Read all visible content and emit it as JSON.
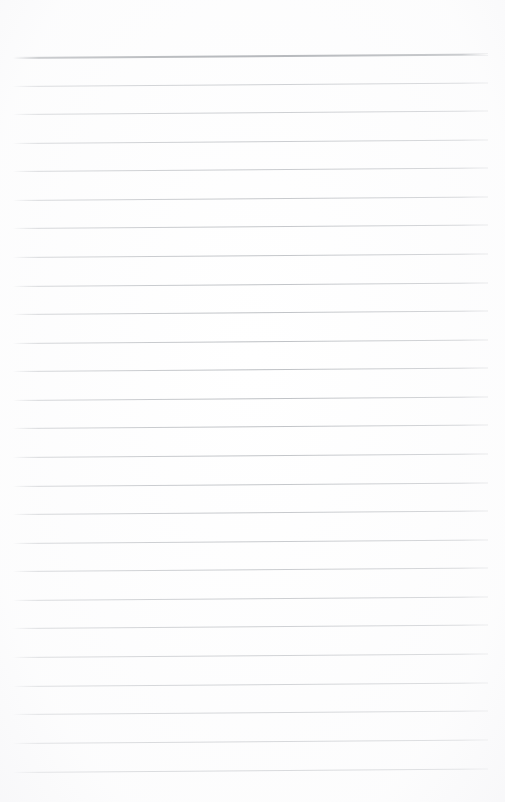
{
  "page": {
    "label": "Blank ruled notepad page",
    "background_color": "#ffffff",
    "width": 505,
    "height": 802,
    "content_text": "",
    "has_handwriting": false,
    "has_margin_rule": false
  },
  "rules": {
    "label": "Horizontal ruled lines",
    "count": 26,
    "line_color": "#b9bcc0",
    "header_line_color": "#8f9398",
    "first_line_y": 57,
    "last_line_y": 772,
    "spacing": 28.6,
    "left_x": 13,
    "right_x": 488,
    "skew_degrees": -0.42,
    "lines": [
      {
        "index": 1,
        "y": 57,
        "emphasis": "header"
      },
      {
        "index": 2,
        "y": 86,
        "emphasis": "normal"
      },
      {
        "index": 3,
        "y": 114,
        "emphasis": "normal"
      },
      {
        "index": 4,
        "y": 143,
        "emphasis": "normal"
      },
      {
        "index": 5,
        "y": 171,
        "emphasis": "normal"
      },
      {
        "index": 6,
        "y": 200,
        "emphasis": "normal"
      },
      {
        "index": 7,
        "y": 228,
        "emphasis": "normal"
      },
      {
        "index": 8,
        "y": 257,
        "emphasis": "normal"
      },
      {
        "index": 9,
        "y": 286,
        "emphasis": "normal"
      },
      {
        "index": 10,
        "y": 314,
        "emphasis": "normal"
      },
      {
        "index": 11,
        "y": 343,
        "emphasis": "normal"
      },
      {
        "index": 12,
        "y": 371,
        "emphasis": "normal"
      },
      {
        "index": 13,
        "y": 400,
        "emphasis": "normal"
      },
      {
        "index": 14,
        "y": 428,
        "emphasis": "normal"
      },
      {
        "index": 15,
        "y": 457,
        "emphasis": "normal"
      },
      {
        "index": 16,
        "y": 486,
        "emphasis": "normal"
      },
      {
        "index": 17,
        "y": 514,
        "emphasis": "normal"
      },
      {
        "index": 18,
        "y": 543,
        "emphasis": "normal"
      },
      {
        "index": 19,
        "y": 571,
        "emphasis": "normal"
      },
      {
        "index": 20,
        "y": 600,
        "emphasis": "normal"
      },
      {
        "index": 21,
        "y": 628,
        "emphasis": "normal"
      },
      {
        "index": 22,
        "y": 657,
        "emphasis": "normal"
      },
      {
        "index": 23,
        "y": 686,
        "emphasis": "normal"
      },
      {
        "index": 24,
        "y": 714,
        "emphasis": "normal"
      },
      {
        "index": 25,
        "y": 743,
        "emphasis": "normal"
      },
      {
        "index": 26,
        "y": 772,
        "emphasis": "normal"
      }
    ]
  }
}
